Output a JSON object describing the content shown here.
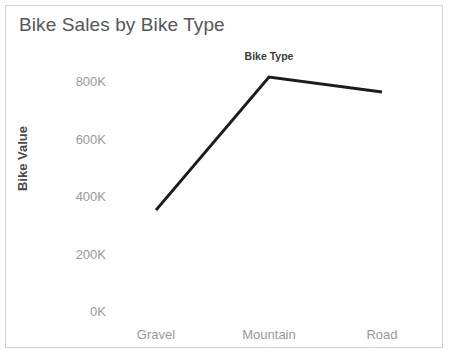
{
  "chart_data": {
    "type": "line",
    "title": "Bike Sales by Bike Type",
    "column_header": "Bike Type",
    "categories": [
      "Gravel",
      "Mountain",
      "Road"
    ],
    "values": [
      351000,
      814000,
      762000
    ],
    "value_labels": [
      "351K",
      "814K",
      "762K"
    ],
    "series": [
      {
        "name": "Bike Value",
        "values": [
          351000,
          814000,
          762000
        ]
      }
    ],
    "xlabel": "Bike Type",
    "ylabel": "Bike Value",
    "ylim": [
      0,
      900000
    ],
    "yticks": [
      0,
      200000,
      400000,
      600000,
      800000
    ],
    "ytick_labels": [
      "0K",
      "200K",
      "400K",
      "600K",
      "800K"
    ],
    "xtick_labels": [
      "Gravel",
      "Mountain",
      "Road"
    ],
    "grid": false,
    "legend": false,
    "legend_position": "none",
    "line_color": "#1c1c1c",
    "line_width": 3,
    "axis_label_color": "#97999b",
    "title_color": "#555759",
    "border_color": "#d4d4d4",
    "background": "#ffffff"
  },
  "chart": {
    "title": "Bike Sales by Bike Type",
    "column_header": "Bike Type",
    "y_axis_title": "Bike Value",
    "y_ticks": [
      {
        "label": "800K",
        "value": 800000
      },
      {
        "label": "600K",
        "value": 600000
      },
      {
        "label": "400K",
        "value": 400000
      },
      {
        "label": "200K",
        "value": 200000
      },
      {
        "label": "0K",
        "value": 0
      }
    ],
    "x_ticks": [
      {
        "label": "Gravel"
      },
      {
        "label": "Mountain"
      },
      {
        "label": "Road"
      }
    ]
  }
}
